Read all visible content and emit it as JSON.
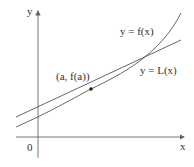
{
  "diagram": {
    "labels": {
      "y_axis": "y",
      "x_axis": "x",
      "origin": "0",
      "curve": "y = f(x)",
      "tangent": "y = L(x)",
      "point": "(a, f(a))"
    },
    "colors": {
      "curve": "#555555",
      "axis": "#666666",
      "point": "#222222"
    }
  }
}
